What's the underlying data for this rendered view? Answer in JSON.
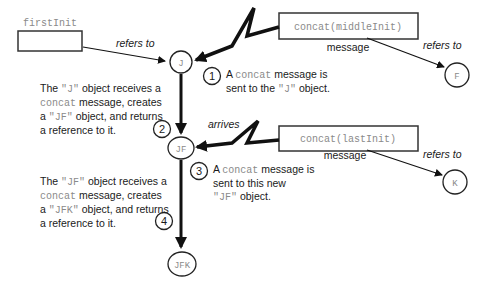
{
  "variables": {
    "first": {
      "name": "firstInit",
      "refers_label": "refers to"
    }
  },
  "objects": {
    "j": "J",
    "jf": "JF",
    "jfk": "JFK",
    "f": "F",
    "k": "K"
  },
  "messages": {
    "m1": {
      "text": "concat(middleInit)",
      "caption": "message",
      "refers_label": "refers to"
    },
    "m2": {
      "text": "concat(lastInit)",
      "caption": "message",
      "refers_label": "refers to",
      "arrives_label": "arrives"
    }
  },
  "steps": [
    {
      "number": "1",
      "pre": "A ",
      "code": "concat",
      "post": " message is",
      "line2": "sent to the ",
      "code2": "\"J\"",
      "post2": " object."
    },
    {
      "number": "2"
    },
    {
      "number": "3",
      "pre": "A ",
      "code": "concat",
      "post": " message is",
      "line2": "sent to this new",
      "code3": "\"JF\"",
      "post3": " object."
    },
    {
      "number": "4"
    }
  ],
  "notes": {
    "n1": {
      "l1a": "The ",
      "l1code": "\"J\"",
      "l1b": " object receives a",
      "l2code": "concat",
      "l2b": " message, creates",
      "l3a": "a ",
      "l3code": "\"JF\"",
      "l3b": " object, and returns",
      "l4": "a reference to it."
    },
    "n2": {
      "l1a": "The ",
      "l1code": "\"JF\"",
      "l1b": " object receives a",
      "l2code": "concat",
      "l2b": " message, creates",
      "l3a": "a ",
      "l3code": "\"JFK\"",
      "l3b": " object, and returns",
      "l4": "a reference to it."
    }
  }
}
